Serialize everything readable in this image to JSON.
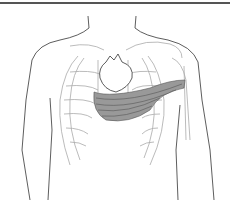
{
  "image": {
    "subject": "Anatomical line illustration of a human torso showing rib cage, heart and the pectoralis minor/major muscle spanning toward the left shoulder",
    "colors": {
      "background": "#ffffff",
      "outline": "#333333",
      "bone": "#9a9a9a",
      "muscle_fill": "#8c8c8c",
      "muscle_stripe": "#5a5a5a",
      "top_rule": "#555555"
    }
  }
}
